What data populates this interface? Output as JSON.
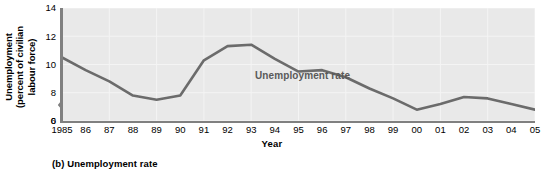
{
  "figure": {
    "caption": "(b) Unemployment rate"
  },
  "chart_data": {
    "type": "line",
    "title": "",
    "xlabel": "Year",
    "ylabel": "Unemployment (percent of civilian labour force)",
    "ylabel_lines": [
      "Unemployment",
      "(percent of civilian",
      "labour force)"
    ],
    "annotation": "Unemployment rate",
    "grid": true,
    "legend_position": "inline-annotation",
    "xlim": [
      1985,
      2005
    ],
    "ylim": [
      6,
      14
    ],
    "yticks": [
      0,
      6,
      8,
      10,
      12,
      14
    ],
    "y_axis_break": true,
    "y_axis_break_between": [
      0,
      6
    ],
    "categories": [
      "1985",
      "86",
      "87",
      "88",
      "89",
      "90",
      "91",
      "92",
      "93",
      "94",
      "95",
      "96",
      "97",
      "98",
      "99",
      "00",
      "01",
      "02",
      "03",
      "04",
      "05"
    ],
    "x": [
      1985,
      1986,
      1987,
      1988,
      1989,
      1990,
      1991,
      1992,
      1993,
      1994,
      1995,
      1996,
      1997,
      1998,
      1999,
      2000,
      2001,
      2002,
      2003,
      2004,
      2005
    ],
    "values": [
      10.5,
      9.6,
      8.8,
      7.8,
      7.5,
      7.8,
      10.3,
      11.3,
      11.4,
      10.4,
      9.5,
      9.6,
      9.1,
      8.3,
      7.6,
      6.8,
      7.2,
      7.7,
      7.6,
      7.2,
      6.8
    ],
    "series": [
      {
        "name": "Unemployment rate",
        "color": "#6b6b6b",
        "values": [
          10.5,
          9.6,
          8.8,
          7.8,
          7.5,
          7.8,
          10.3,
          11.3,
          11.4,
          10.4,
          9.5,
          9.6,
          9.1,
          8.3,
          7.6,
          6.8,
          7.2,
          7.7,
          7.6,
          7.2,
          6.8
        ]
      }
    ],
    "colors": {
      "line": "#6b6b6b",
      "plot_background": "#e9e9e9",
      "gridline": "#f4f4f4",
      "axis": "#808080",
      "annotation_text": "#595959"
    }
  }
}
